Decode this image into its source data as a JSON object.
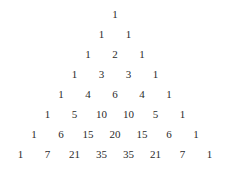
{
  "page": {
    "background_color": "#ffffff",
    "text_color": "#2b2b2b",
    "row_count": 8,
    "column_spacing_px": 27,
    "row_spacing_px": 20
  },
  "chart_data": {
    "type": "table",
    "title": "",
    "subtitle": "",
    "xlabel": "",
    "ylabel": "",
    "layout": "centered-triangle",
    "grid": false,
    "legend": "none",
    "rows": [
      {
        "index": 0,
        "values": [
          "1"
        ]
      },
      {
        "index": 1,
        "values": [
          "1",
          "1"
        ]
      },
      {
        "index": 2,
        "values": [
          "1",
          "2",
          "1"
        ]
      },
      {
        "index": 3,
        "values": [
          "1",
          "3",
          "3",
          "1"
        ]
      },
      {
        "index": 4,
        "values": [
          "1",
          "4",
          "6",
          "4",
          "1"
        ]
      },
      {
        "index": 5,
        "values": [
          "1",
          "5",
          "10",
          "10",
          "5",
          "1"
        ]
      },
      {
        "index": 6,
        "values": [
          "1",
          "6",
          "15",
          "20",
          "15",
          "6",
          "1"
        ]
      },
      {
        "index": 7,
        "values": [
          "1",
          "7",
          "21",
          "35",
          "35",
          "21",
          "7",
          "1"
        ]
      }
    ]
  }
}
